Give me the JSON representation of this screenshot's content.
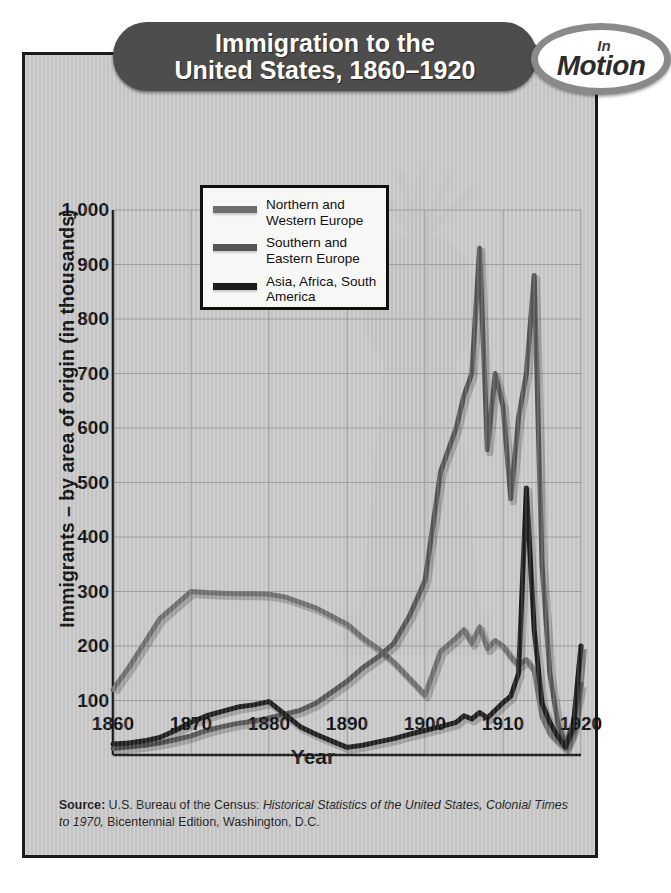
{
  "title": {
    "line1": "Immigration to the",
    "line2": "United States, 1860–1920"
  },
  "badge": {
    "word_top": "In",
    "word_main": "Motion"
  },
  "source": {
    "label": "Source:",
    "text_1": " U.S. Bureau of the Census: ",
    "italic_1": "Historical Statistics of the United States,",
    "italic_2": "Colonial Times to 1970,",
    "text_2": " Bicentennial Edition, Washington, D.C."
  },
  "colors": {
    "panel_background": "#c9c9c9",
    "banner": "#4d4d4d",
    "grid": "#9a9a9a",
    "axis": "#1a1a1a",
    "series_northern_western_europe": "#6e6e6e",
    "series_southern_eastern_europe": "#555555",
    "series_asia_africa_south_america": "#1d1d1d"
  },
  "chart_data": {
    "type": "line",
    "title": "Immigration to the United States, 1860–1920",
    "xlabel": "Year",
    "ylabel": "Immigrants – by area of origin (in thousands)",
    "xlim": [
      1860,
      1920
    ],
    "ylim": [
      0,
      1000
    ],
    "grid": true,
    "legend_position": "upper-left-inside",
    "xticks": [
      "1860",
      "1870",
      "1880",
      "1890",
      "1900",
      "1910",
      "1920"
    ],
    "yticks": [
      "100",
      "200",
      "300",
      "400",
      "500",
      "600",
      "700",
      "800",
      "900",
      "1,000"
    ],
    "x": [
      1860,
      1862,
      1864,
      1866,
      1868,
      1870,
      1872,
      1874,
      1876,
      1878,
      1880,
      1882,
      1884,
      1886,
      1888,
      1890,
      1892,
      1894,
      1896,
      1898,
      1900,
      1902,
      1904,
      1905,
      1906,
      1907,
      1908,
      1909,
      1910,
      1911,
      1912,
      1913,
      1914,
      1915,
      1916,
      1917,
      1918,
      1919,
      1920
    ],
    "series": [
      {
        "name": "Northern and Western Europe",
        "color": "#6e6e6e",
        "values": [
          120,
          160,
          205,
          250,
          275,
          300,
          298,
          297,
          296,
          296,
          295,
          290,
          280,
          270,
          255,
          240,
          215,
          195,
          170,
          140,
          110,
          190,
          215,
          230,
          205,
          235,
          195,
          210,
          200,
          180,
          165,
          175,
          155,
          70,
          40,
          25,
          12,
          45,
          200
        ]
      },
      {
        "name": "Southern and Eastern Europe",
        "color": "#555555",
        "values": [
          12,
          15,
          18,
          22,
          28,
          35,
          45,
          52,
          58,
          62,
          68,
          75,
          82,
          95,
          115,
          135,
          160,
          180,
          205,
          255,
          320,
          520,
          600,
          660,
          700,
          930,
          560,
          700,
          640,
          470,
          620,
          700,
          880,
          350,
          150,
          60,
          20,
          60,
          130
        ]
      },
      {
        "name": "Asia, Africa, South America",
        "color": "#1d1d1d",
        "values": [
          20,
          22,
          26,
          32,
          45,
          60,
          72,
          80,
          88,
          92,
          98,
          75,
          52,
          38,
          26,
          14,
          18,
          24,
          30,
          38,
          45,
          52,
          60,
          72,
          66,
          78,
          68,
          82,
          96,
          108,
          150,
          490,
          230,
          95,
          60,
          35,
          15,
          50,
          200
        ]
      }
    ]
  }
}
